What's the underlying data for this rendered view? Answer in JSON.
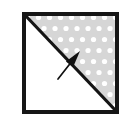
{
  "figure": {
    "title": "Square with diagonal and normal arrow",
    "canvas": {
      "width": 125,
      "height": 121,
      "background": "#ffffff"
    },
    "square": {
      "label": "square-outline",
      "x": 22,
      "y": 12,
      "width": 97,
      "height": 102,
      "border_color": "#161616",
      "border_width": 4,
      "fill": "#ffffff"
    },
    "diagonal": {
      "label": "diagonal-line",
      "from": {
        "x": 24,
        "y": 14
      },
      "to": {
        "x": 117,
        "y": 112
      },
      "color": "#141414",
      "width": 3.2,
      "description": "diagonal from top-left corner to bottom-right corner"
    },
    "regions": [
      {
        "name": "upper-right-region",
        "fill_style": "stippled",
        "fill_color": "#d6d6d6",
        "dot_color": "#ffffff",
        "dot_radius": 2.6,
        "dot_spacing": 11,
        "points": "24,14 117,14 117,112"
      },
      {
        "name": "lower-left-region",
        "fill_style": "solid",
        "fill_color": "#ffffff",
        "points": "24,14 24,112 117,112"
      }
    ],
    "arrow": {
      "label": "normal-arrow",
      "tail": {
        "x": 58,
        "y": 79
      },
      "tip": {
        "x": 80,
        "y": 51
      },
      "color": "#111111",
      "shaft_width": 1.7,
      "head_length": 17,
      "head_width": 9,
      "description": "arrow pointing up-right into the shaded region, normal to the diagonal"
    }
  }
}
